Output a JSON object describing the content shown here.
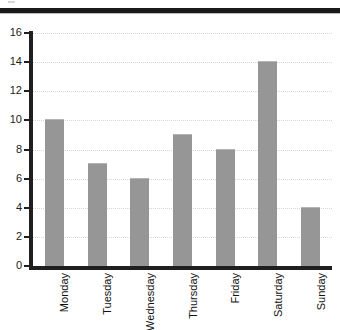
{
  "chart_data": {
    "type": "bar",
    "title": "",
    "xlabel": "",
    "ylabel": "",
    "categories": [
      "Monday",
      "Tuesday",
      "Wednesday",
      "Thursday",
      "Friday",
      "Saturday",
      "Sunday"
    ],
    "values": [
      10,
      7,
      6,
      9,
      8,
      14,
      4
    ],
    "ylim": [
      0,
      16
    ],
    "ytick_labels": [
      "0",
      "2",
      "4",
      "6",
      "8",
      "10",
      "12",
      "14",
      "16"
    ],
    "ytick_values": [
      0,
      2,
      4,
      6,
      8,
      10,
      12,
      14,
      16
    ],
    "grid": "horizontal-dotted",
    "legend": "none",
    "bar_color": "#969696",
    "axis_color": "#1f1f1f",
    "grid_color": "#d8d8d8",
    "xlabel_rotation": "90"
  },
  "decor": {
    "top_rule_color": "#1a1a1a"
  }
}
